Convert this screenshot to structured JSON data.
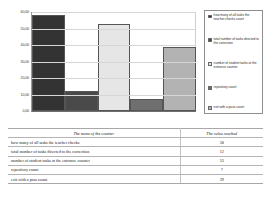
{
  "chart_data": {
    "type": "bar",
    "title": "",
    "xlabel": "",
    "ylabel": "",
    "ylim": [
      0,
      60
    ],
    "grid": true,
    "legend_position": "right",
    "categories": [
      "how many of all tasks the teacher checks",
      "total number of tasks directed to the correction",
      "number of student tasks at the entrance  counter",
      "repository  count",
      "exit with a pass  count"
    ],
    "values": [
      58,
      12,
      53,
      7,
      39
    ],
    "tick_labels": [
      "0,00",
      "10,00",
      "20,00",
      "30,00",
      "40,00",
      "50,00",
      "60,00"
    ],
    "tick_values": [
      0,
      10,
      20,
      30,
      40,
      50,
      60
    ],
    "colors": [
      "#333333",
      "#4a4a4a",
      "#e6e6e6",
      "#6f6f6f",
      "#b3b3b3"
    ],
    "legend": [
      "how many of all tasks the teacher checks count",
      "total number of tasks directed to the correction",
      "number of student tasks at the entrance  counter",
      "repository  count",
      "exit with a pass  count"
    ]
  },
  "table": {
    "headers": [
      "The name of the counter",
      "The value reached"
    ],
    "rows": [
      {
        "name": "how many of all tasks the teacher checks",
        "value": "58"
      },
      {
        "name": "total number of tasks directed to the correction",
        "value": "12"
      },
      {
        "name": "number of student tasks at the entrance  counter",
        "value": "53"
      },
      {
        "name": "repository  count",
        "value": "7"
      },
      {
        "name": "exit with a pass  count",
        "value": "39"
      }
    ]
  }
}
